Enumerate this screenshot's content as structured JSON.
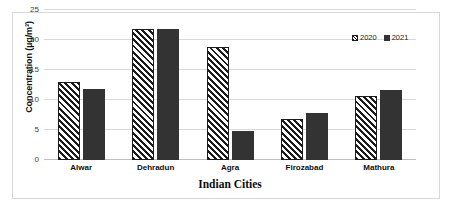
{
  "chart_data": {
    "type": "bar",
    "title": "",
    "xlabel": "Indian Cities",
    "ylabel": "Concentration (µg/m³)",
    "categories": [
      "Alwar",
      "Dehradun",
      "Agra",
      "Firozabad",
      "Mathura"
    ],
    "series": [
      {
        "name": "2020",
        "values": [
          13.0,
          21.9,
          18.9,
          6.9,
          10.6
        ],
        "pattern": "diagonal-hatch",
        "color": "#1c1c1c"
      },
      {
        "name": "2021",
        "values": [
          11.9,
          21.8,
          4.8,
          7.8,
          11.7
        ],
        "pattern": "solid",
        "color": "#333333"
      }
    ],
    "ylim": [
      0,
      25
    ],
    "yticks": [
      0,
      5,
      10,
      15,
      20,
      25
    ],
    "ytick_labels": [
      "0",
      "5",
      "10",
      "15",
      "20",
      "25"
    ],
    "grid": "horizontal",
    "legend_position": "top-right",
    "legend_entries": [
      "2020",
      "2021"
    ]
  }
}
